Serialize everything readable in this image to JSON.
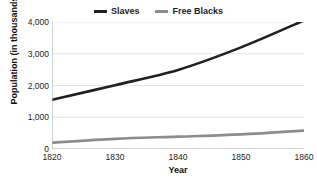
{
  "chart_data": {
    "type": "line",
    "title": "",
    "xlabel": "Year",
    "ylabel": "Population (in thousands)",
    "x": [
      1820,
      1830,
      1840,
      1850,
      1860
    ],
    "xtick_labels": [
      "1820",
      "1830",
      "1840",
      "1850",
      "1860"
    ],
    "xlim": [
      1820,
      1860
    ],
    "ylim": [
      0,
      4000
    ],
    "ytick_values": [
      0,
      1000,
      2000,
      3000,
      4000
    ],
    "ytick_labels": [
      "0",
      "1,000",
      "2,000",
      "3,000",
      "4,000"
    ],
    "grid": "horizontal",
    "legend_position": "top-center",
    "series": [
      {
        "name": "Slaves",
        "color": "#231f20",
        "values": [
          1550,
          2010,
          2490,
          3200,
          4050
        ]
      },
      {
        "name": "Free Blacks",
        "color": "#8c8c8c",
        "values": [
          200,
          320,
          390,
          460,
          580
        ]
      }
    ]
  },
  "axis_colors": {
    "gridline": "#e3e3e3",
    "axis_line": "#a8a8a8",
    "tick_text": "#1d1d1d",
    "title_text": "#111111"
  }
}
